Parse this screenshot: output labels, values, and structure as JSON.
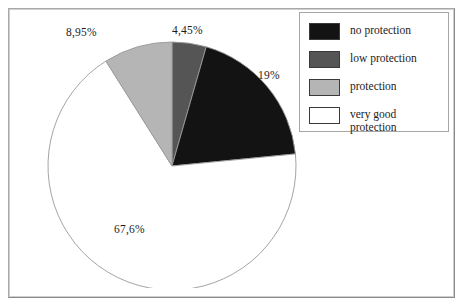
{
  "figure": {
    "background_color": "#ffffff",
    "frame_color": "#a8a8a8"
  },
  "legend": {
    "position": "right",
    "items": [
      {
        "label": "no protection",
        "color": "#131313",
        "swatch_name": "legend-swatch-no-protection"
      },
      {
        "label": "low protection",
        "color": "#555555",
        "swatch_name": "legend-swatch-low-protection"
      },
      {
        "label": "protection",
        "color": "#b5b5b5",
        "swatch_name": "legend-swatch-protection"
      },
      {
        "label": "very good protection",
        "color": "#ffffff",
        "swatch_name": "legend-swatch-very-good-protection"
      }
    ]
  },
  "labels": {
    "no_protection": "19%",
    "low_protection": "4,45%",
    "protection": "8,95%",
    "very_good_protection": "67,6%"
  },
  "chart_data": {
    "type": "pie",
    "title": "",
    "xlabel": "",
    "ylabel": "",
    "grid": false,
    "legend_position": "right",
    "start_angle_deg": 90,
    "direction": "clockwise",
    "categories": [
      "low protection",
      "no protection",
      "very good protection",
      "protection"
    ],
    "values": [
      4.45,
      19,
      67.6,
      8.95
    ],
    "value_labels": [
      "4,45%",
      "19%",
      "67,6%",
      "8,95%"
    ],
    "colors": [
      "#555555",
      "#131313",
      "#ffffff",
      "#b5b5b5"
    ],
    "units": "percent",
    "total": 100,
    "slices": [
      {
        "name": "low protection",
        "value": 4.45,
        "label": "4,45%",
        "color": "#555555",
        "start_deg": 0,
        "sweep_deg": 16.02
      },
      {
        "name": "no protection",
        "value": 19,
        "label": "19%",
        "color": "#131313",
        "start_deg": 16.02,
        "sweep_deg": 68.4
      },
      {
        "name": "very good protection",
        "value": 67.6,
        "label": "67,6%",
        "color": "#ffffff",
        "start_deg": 84.42,
        "sweep_deg": 243.36
      },
      {
        "name": "protection",
        "value": 8.95,
        "label": "8,95%",
        "color": "#b5b5b5",
        "start_deg": 327.78,
        "sweep_deg": 32.22
      }
    ]
  }
}
